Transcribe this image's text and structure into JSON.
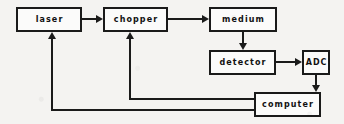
{
  "diagram": {
    "type": "block-flow-diagram",
    "background_color": "#f4f3f1",
    "line_color": "#1a1a1a",
    "box_fill_color": "#fbfbfa",
    "nodes": [
      {
        "id": "laser",
        "label": "laser",
        "x": 16,
        "y": 7,
        "w": 66,
        "h": 25,
        "case": "lower"
      },
      {
        "id": "chopper",
        "label": "chopper",
        "x": 103,
        "y": 7,
        "w": 65,
        "h": 25,
        "case": "lower"
      },
      {
        "id": "medium",
        "label": "medium",
        "x": 209,
        "y": 7,
        "w": 68,
        "h": 25,
        "case": "lower"
      },
      {
        "id": "detector",
        "label": "detector",
        "x": 209,
        "y": 50,
        "w": 67,
        "h": 25,
        "case": "lower"
      },
      {
        "id": "adc",
        "label": "ADC",
        "x": 302,
        "y": 50,
        "w": 28,
        "h": 25,
        "case": "upper"
      },
      {
        "id": "computer",
        "label": "computer",
        "x": 254,
        "y": 92,
        "w": 67,
        "h": 25,
        "case": "lower"
      }
    ],
    "edges": [
      {
        "id": "laser-to-chopper",
        "from": "laser",
        "to": "chopper",
        "direction": "right"
      },
      {
        "id": "chopper-to-medium",
        "from": "chopper",
        "to": "medium",
        "direction": "right"
      },
      {
        "id": "medium-to-detector",
        "from": "medium",
        "to": "detector",
        "direction": "down"
      },
      {
        "id": "detector-to-adc",
        "from": "detector",
        "to": "adc",
        "direction": "right"
      },
      {
        "id": "adc-to-computer",
        "from": "adc",
        "to": "computer",
        "direction": "down"
      },
      {
        "id": "computer-to-chopper",
        "from": "computer",
        "to": "chopper",
        "direction": "up"
      },
      {
        "id": "computer-to-laser",
        "from": "computer",
        "to": "laser",
        "direction": "up"
      }
    ]
  }
}
